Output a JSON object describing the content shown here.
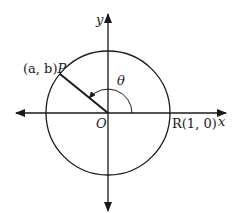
{
  "diagram": {
    "type": "unit-circle",
    "labels": {
      "y_axis": "y",
      "x_axis": "x",
      "origin": "O",
      "angle": "θ",
      "point_p_coords": "(a, b)",
      "point_p_name": "P",
      "point_r": "R(1, 0)"
    },
    "colors": {
      "stroke": "#1a1a1a",
      "background": "#ffffff"
    },
    "geometry": {
      "origin_px": [
        108,
        113
      ],
      "radius_px": 62,
      "point_p_px": [
        60,
        74
      ],
      "angle_arc_radius_px": 24
    }
  }
}
